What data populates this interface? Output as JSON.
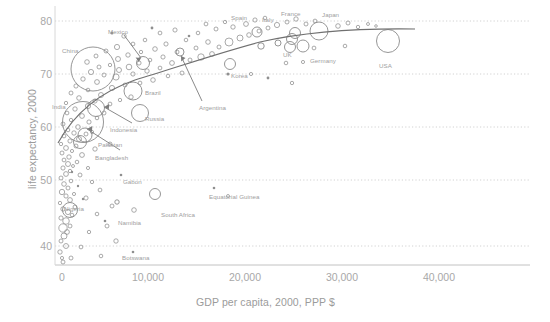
{
  "chart_data": {
    "type": "scatter",
    "title": "",
    "subtitle": "",
    "xlabel": "GDP per capita, 2000, PPP $",
    "ylabel": "life expectancy, 2000",
    "xlim": [
      0,
      48000
    ],
    "ylim": [
      36,
      82
    ],
    "xticks": [
      "0",
      "10,000",
      "20,000",
      "30,000",
      "40,000"
    ],
    "xtick_values": [
      0,
      10000,
      20000,
      30000,
      40000
    ],
    "yticks": [
      "40",
      "50",
      "60",
      "70",
      "80"
    ],
    "ytick_values": [
      40,
      50,
      60,
      70,
      80
    ],
    "grid": "horizontal-dotted",
    "legend": "none",
    "bubble_size_encodes": "population",
    "note": "Bubble area scales with country population; a fitted log trend curve is overlaid.",
    "series": [
      {
        "name": "countries",
        "marker": "open-circle",
        "color": "#8a8a8a",
        "points": [
          {
            "label": "China",
            "x": 3900,
            "y": 71.0,
            "r": 22.0,
            "labeled": true
          },
          {
            "label": "India",
            "x": 2400,
            "y": 63.5,
            "r": 20.5,
            "labeled": true
          },
          {
            "label": "USA",
            "x": 34300,
            "y": 77.0,
            "r": 11.5,
            "labeled": true
          },
          {
            "label": "Indonesia",
            "x": 3000,
            "y": 66.5,
            "r": 8.5,
            "labeled": true
          },
          {
            "label": "Brazil",
            "x": 7300,
            "y": 68.5,
            "r": 9.0,
            "labeled": true
          },
          {
            "label": "Russia",
            "x": 8000,
            "y": 65.5,
            "r": 8.5,
            "labeled": true
          },
          {
            "label": "Pakistan",
            "x": 1900,
            "y": 61.5,
            "r": 7.0,
            "labeled": true
          },
          {
            "label": "Bangladesh",
            "x": 1600,
            "y": 60.5,
            "r": 6.5,
            "labeled": true
          },
          {
            "label": "Japan",
            "x": 26800,
            "y": 79.5,
            "r": 9.0,
            "labeled": true
          },
          {
            "label": "Nigeria",
            "x": 900,
            "y": 47.5,
            "r": 7.5,
            "labeled": true
          },
          {
            "label": "Mexico",
            "x": 9000,
            "y": 74.5,
            "r": 6.5,
            "labeled": true
          },
          {
            "label": "Germany",
            "x": 25500,
            "y": 78.0,
            "r": 6.0,
            "labeled": true
          },
          {
            "label": "France",
            "x": 24400,
            "y": 79.0,
            "r": 5.5,
            "labeled": true
          },
          {
            "label": "UK",
            "x": 24300,
            "y": 77.5,
            "r": 5.5,
            "labeled": true
          },
          {
            "label": "Italy",
            "x": 24800,
            "y": 79.5,
            "r": 5.5,
            "labeled": true
          },
          {
            "label": "Spain",
            "x": 20200,
            "y": 79.5,
            "r": 5.0,
            "labeled": true
          },
          {
            "label": "Korea",
            "x": 17400,
            "y": 76.0,
            "r": 5.5,
            "labeled": true
          },
          {
            "label": "Argentina",
            "x": 12500,
            "y": 74.0,
            "r": 4.0,
            "labeled": true
          },
          {
            "label": "South Africa",
            "x": 9500,
            "y": 48.0,
            "r": 5.5,
            "labeled": true
          },
          {
            "label": "Namibia",
            "x": 6500,
            "y": 47.0,
            "r": 2.0,
            "labeled": true
          },
          {
            "label": "Botswana",
            "x": 7200,
            "y": 39.5,
            "r": 1.5,
            "labeled": true
          },
          {
            "label": "Gabon",
            "x": 5700,
            "y": 52.5,
            "r": 1.5,
            "labeled": true
          },
          {
            "label": "Equatorial Guinea",
            "x": 15200,
            "y": 51.0,
            "r": 1.2,
            "labeled": true
          }
        ]
      }
    ],
    "annotations": [
      {
        "text": "Mexico",
        "kind": "arrow-callout",
        "points_to": "Mexico bubble"
      },
      {
        "text": "Argentina",
        "kind": "arrow-callout",
        "points_to": "Argentina bubble"
      },
      {
        "text": "Indonesia",
        "kind": "arrow-callout",
        "points_to": "Indonesia bubble"
      },
      {
        "text": "Bangladesh",
        "kind": "arrow-callout",
        "points_to": "Bangladesh bubble"
      }
    ]
  },
  "axes": {
    "x_title": "GDP per capita, 2000, PPP $",
    "y_title": "life expectancy, 2000",
    "x_ticks": [
      {
        "label": "0",
        "px": 62
      },
      {
        "label": "10,000",
        "px": 148
      },
      {
        "label": "20,000",
        "px": 245
      },
      {
        "label": "30,000",
        "px": 342
      },
      {
        "label": "40,000",
        "px": 439
      }
    ],
    "y_ticks": [
      {
        "label": "80",
        "px": 21
      },
      {
        "label": "70",
        "px": 74
      },
      {
        "label": "60",
        "px": 127
      },
      {
        "label": "50",
        "px": 180
      },
      {
        "label": "40",
        "px": 246
      }
    ]
  },
  "colors": {
    "marker": "#8a8a8a",
    "grid": "#c8c8c8",
    "axis": "#bdbdbd",
    "text": "#9e9e9e",
    "trend": "#6e6e6e",
    "background": "#ffffff"
  },
  "point_labels": [
    {
      "text": "China",
      "left": 62,
      "top": 47
    },
    {
      "text": "Mexico",
      "left": 108,
      "top": 28
    },
    {
      "text": "Spain",
      "left": 231,
      "top": 14
    },
    {
      "text": "Italy",
      "left": 262,
      "top": 16
    },
    {
      "text": "France",
      "left": 281,
      "top": 10
    },
    {
      "text": "Japan",
      "left": 322,
      "top": 11
    },
    {
      "text": "UK",
      "left": 283,
      "top": 51
    },
    {
      "text": "Germany",
      "left": 310,
      "top": 57
    },
    {
      "text": "USA",
      "left": 379,
      "top": 62
    },
    {
      "text": "Korea",
      "left": 231,
      "top": 72
    },
    {
      "text": "Brazil",
      "left": 145,
      "top": 89
    },
    {
      "text": "Russia",
      "left": 145,
      "top": 115
    },
    {
      "text": "India",
      "left": 52,
      "top": 103
    },
    {
      "text": "Indonesia",
      "left": 110,
      "top": 126
    },
    {
      "text": "Pakistan",
      "left": 98,
      "top": 141
    },
    {
      "text": "Bangladesh",
      "left": 95,
      "top": 154
    },
    {
      "text": "Argentina",
      "left": 199,
      "top": 104
    },
    {
      "text": "Gabon",
      "left": 123,
      "top": 178
    },
    {
      "text": "Equatorial Guinea",
      "left": 209,
      "top": 193
    },
    {
      "text": "Nigeria",
      "left": 64,
      "top": 205
    },
    {
      "text": "South Africa",
      "left": 161,
      "top": 211
    },
    {
      "text": "Namibia",
      "left": 118,
      "top": 219
    },
    {
      "text": "Botswana",
      "left": 122,
      "top": 254
    }
  ]
}
